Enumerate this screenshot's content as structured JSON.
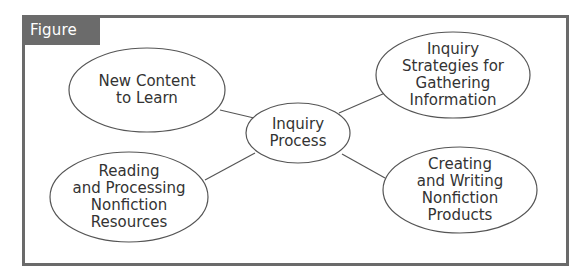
{
  "figure": {
    "title": "Figure 4.1",
    "colors": {
      "frame": "#6a6a6a",
      "title_bg": "#6b6b6b",
      "title_text": "#ffffff",
      "stroke": "#555555",
      "text": "#333333"
    }
  },
  "nodes": {
    "center": {
      "lines": [
        "Inquiry",
        "Process"
      ],
      "cx": 298,
      "cy": 133,
      "rx": 52,
      "ry": 30
    },
    "top_left": {
      "lines": [
        "New Content",
        "to Learn"
      ],
      "cx": 147,
      "cy": 90,
      "rx": 78,
      "ry": 42
    },
    "top_right": {
      "lines": [
        "Inquiry",
        "Strategies for",
        "Gathering",
        "Information"
      ],
      "cx": 453,
      "cy": 75,
      "rx": 77,
      "ry": 43
    },
    "bottom_left": {
      "lines": [
        "Reading",
        "and Processing",
        "Nonfiction",
        "Resources"
      ],
      "cx": 129,
      "cy": 197,
      "rx": 79,
      "ry": 45
    },
    "bottom_right": {
      "lines": [
        "Creating",
        "and Writing",
        "Nonfiction",
        "Products"
      ],
      "cx": 460,
      "cy": 190,
      "rx": 77,
      "ry": 43
    }
  },
  "edges": [
    {
      "from": "center",
      "to": "top_left"
    },
    {
      "from": "center",
      "to": "top_right"
    },
    {
      "from": "center",
      "to": "bottom_left"
    },
    {
      "from": "center",
      "to": "bottom_right"
    }
  ]
}
